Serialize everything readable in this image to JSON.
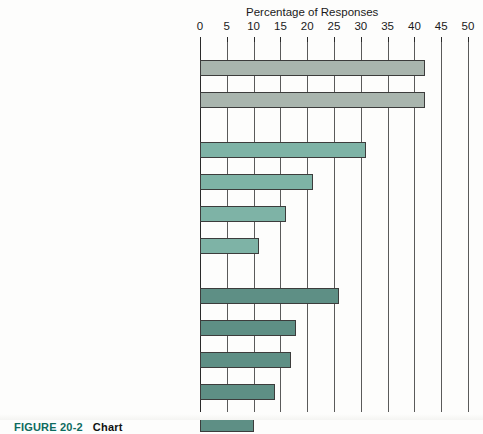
{
  "figure": {
    "caption_label": "FIGURE 20-2",
    "caption_text": "Chart"
  },
  "chart_data": {
    "type": "bar",
    "orientation": "horizontal",
    "title": "Percentage of Responses",
    "xlabel": "Percentage of Responses",
    "ylabel": "",
    "xlim": [
      0,
      50
    ],
    "xticks": [
      0,
      5,
      10,
      15,
      20,
      25,
      30,
      35,
      40,
      45,
      50
    ],
    "xtick_labels": [
      "0",
      "5",
      "10",
      "15",
      "20",
      "25",
      "30",
      "35",
      "40",
      "45",
      "50"
    ],
    "grid": true,
    "grid_axis": "x",
    "legend": false,
    "groups": [
      {
        "name": "Management Orientation",
        "color": "#a9b5ae",
        "items": [
          {
            "label": "Lack of Attention\nto New Products",
            "value": 42
          },
          {
            "label": "Emphasis on\nShort-Term Profitability",
            "value": 42
          }
        ]
      },
      {
        "name": "Management Practices",
        "color": "#7eb3a6",
        "items": [
          {
            "label": "Inadequate Market Research",
            "value": 31
          },
          {
            "label": "Lack of New Product Strategy",
            "value": 21
          },
          {
            "label": "Lack of Measurement Criteria",
            "value": 16
          },
          {
            "label": "Lack of Proven\nAnalytical Techniques",
            "value": 11
          }
        ]
      },
      {
        "name": "Organization",
        "color": "#5e8f85",
        "items": [
          {
            "label": "Delays in Making Decisions",
            "value": 26
          },
          {
            "label": "Ineffective Communication\nBetween Functions and Departments",
            "value": 18
          },
          {
            "label": "Current\nOrganizational Structure",
            "value": 17
          },
          {
            "label": "Unclear Assignment of Ultimate\nNew Product Responsibility",
            "value": 14
          },
          {
            "label": "Excessive Top Management\nInvolvement in Process Details",
            "value": 10
          },
          {
            "label": "Lack of General Business Skills\nAmong New Product Managers",
            "value": 6
          }
        ]
      }
    ],
    "categories": [
      "Lack of Attention to New Products",
      "Emphasis on Short-Term Profitability",
      "Inadequate Market Research",
      "Lack of New Product Strategy",
      "Lack of Measurement Criteria",
      "Lack of Proven Analytical Techniques",
      "Delays in Making Decisions",
      "Ineffective Communication Between Functions and Departments",
      "Current Organizational Structure",
      "Unclear Assignment of Ultimate New Product Responsibility",
      "Excessive Top Management Involvement in Process Details",
      "Lack of General Business Skills Among New Product Managers"
    ],
    "values": [
      42,
      42,
      31,
      21,
      16,
      11,
      26,
      18,
      17,
      14,
      10,
      6
    ],
    "colors": {
      "management_orientation": "#a9b5ae",
      "management_practices": "#7eb3a6",
      "organization": "#5e8f85",
      "bar_outline": "#3c3c3c",
      "gridline": "#5a5a5a"
    }
  }
}
